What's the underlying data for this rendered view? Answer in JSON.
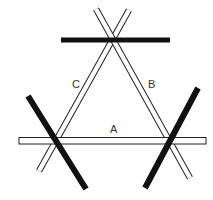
{
  "diagram": {
    "colors": {
      "background": "#ffffff",
      "stick_fill": "#ffffff",
      "stick_stroke": "#222222",
      "bar_fill": "#111111",
      "label": "#333333"
    },
    "labels": {
      "a": "A",
      "b": "B",
      "c": "C"
    },
    "sticks": [
      {
        "id": "A",
        "type": "white",
        "x1": 19,
        "y1": 140.5,
        "x2": 206,
        "y2": 140.5,
        "width": 6
      },
      {
        "id": "B",
        "type": "white",
        "x1": 96,
        "y1": 9,
        "x2": 190,
        "y2": 178,
        "width": 6
      },
      {
        "id": "C",
        "type": "white",
        "x1": 129,
        "y1": 10,
        "x2": 39,
        "y2": 171,
        "width": 6
      }
    ],
    "bars": [
      {
        "id": "top",
        "type": "black",
        "x1": 61,
        "y1": 40,
        "x2": 170,
        "y2": 40,
        "width": 5
      },
      {
        "id": "left",
        "type": "black",
        "x1": 28,
        "y1": 96,
        "x2": 86,
        "y2": 189,
        "width": 6
      },
      {
        "id": "right",
        "type": "black",
        "x1": 198,
        "y1": 88,
        "x2": 145,
        "y2": 188,
        "width": 6
      }
    ]
  }
}
